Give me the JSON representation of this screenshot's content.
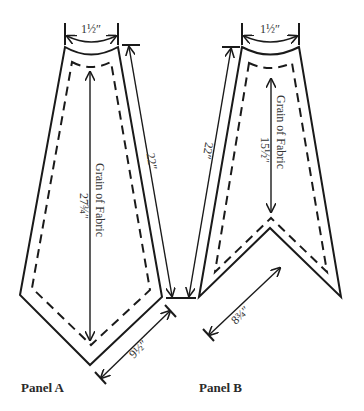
{
  "figure": {
    "panels": [
      {
        "id": "A",
        "label": "Panel A",
        "top_width": "1½″",
        "side_length": "22″",
        "grain_label": "Grain of Fabric",
        "grain_length": "27¾″",
        "bottom_edge": "9½″"
      },
      {
        "id": "B",
        "label": "Panel B",
        "top_width": "1½″",
        "side_length": "22″",
        "grain_label": "Grain of Fabric",
        "grain_length": "15½″",
        "bottom_edge": "8¾″"
      }
    ],
    "colors": {
      "line": "#1a1a1a",
      "text": "#333333",
      "background": "#ffffff"
    }
  }
}
